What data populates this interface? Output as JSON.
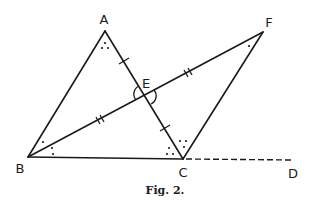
{
  "figure": {
    "caption": "Fig. 2.",
    "line_color": "#1a1a1a",
    "background": "#ffffff"
  },
  "points": {
    "A": {
      "label": "A",
      "x": 105,
      "y": 31
    },
    "B": {
      "label": "B",
      "x": 28,
      "y": 157
    },
    "C": {
      "label": "C",
      "x": 183,
      "y": 159
    },
    "D": {
      "label": "D",
      "x": 293,
      "y": 160
    },
    "E": {
      "label": "E",
      "x": 145,
      "y": 95
    },
    "F": {
      "label": "F",
      "x": 263,
      "y": 32
    }
  },
  "segments": [
    {
      "from": "A",
      "to": "B",
      "style": "solid"
    },
    {
      "from": "A",
      "to": "C",
      "style": "solid",
      "marks": "single tick on AE and EC"
    },
    {
      "from": "B",
      "to": "F",
      "style": "solid",
      "marks": "double tick on BE and EF"
    },
    {
      "from": "B",
      "to": "C",
      "style": "solid"
    },
    {
      "from": "C",
      "to": "F",
      "style": "solid"
    },
    {
      "from": "C",
      "to": "D",
      "style": "dashed"
    }
  ],
  "angle_marks": [
    {
      "vertex": "A",
      "marker": "three dots"
    },
    {
      "vertex": "B",
      "marker": "one dot (upper) and two dots (lower)"
    },
    {
      "vertex": "C",
      "marker": "three dots (interior) and four dots (exterior)"
    },
    {
      "vertex": "F",
      "marker": "one dot"
    },
    {
      "vertex": "E",
      "marker": "vertical angle arcs"
    }
  ]
}
